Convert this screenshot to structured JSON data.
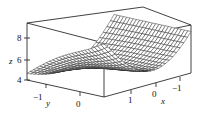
{
  "chart_data": {
    "type": "surface3d",
    "title": "",
    "xlabel": "x",
    "ylabel": "y",
    "zlabel": "z",
    "x_ticks": [
      "1",
      "0",
      "−1"
    ],
    "y_ticks": [
      "−1",
      "0"
    ],
    "z_ticks": [
      "8",
      "6",
      "4"
    ],
    "xlim": [
      -1.5,
      1.5
    ],
    "ylim": [
      -1.5,
      1.5
    ],
    "zlim": [
      4,
      9
    ],
    "grid": false,
    "legend": null
  },
  "labels": {
    "x": "x",
    "y": "y",
    "z": "z",
    "z8": "8",
    "z6": "6",
    "z4": "4",
    "ym1": "−1",
    "y0": "0",
    "x1": "1",
    "x0": "0",
    "xm1": "−1"
  },
  "colors": {
    "line": "#111111",
    "mesh": "#222222",
    "background": "#ffffff"
  }
}
